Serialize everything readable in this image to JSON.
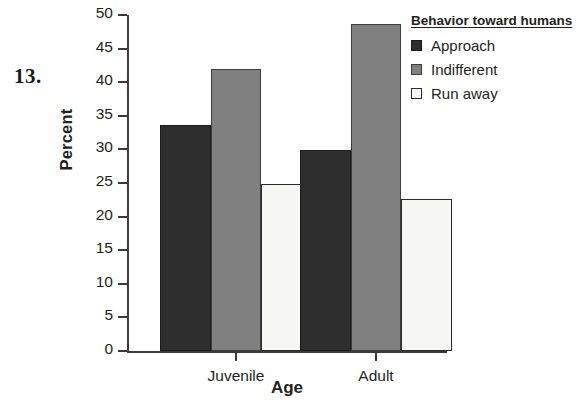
{
  "item_number": "13.",
  "chart_data": {
    "type": "bar",
    "title": "",
    "xlabel": "Age",
    "ylabel": "Percent",
    "categories": [
      "Juvenile",
      "Adult"
    ],
    "series": [
      {
        "name": "Approach",
        "values": [
          33.7,
          29.9
        ],
        "color": "#2e2e2e"
      },
      {
        "name": "Indifferent",
        "values": [
          42.0,
          48.7
        ],
        "color": "#808080"
      },
      {
        "name": "Run away",
        "values": [
          24.8,
          22.6
        ],
        "color": "#f6f6f4"
      }
    ],
    "ylim": [
      0,
      50
    ],
    "yticks": [
      0,
      5,
      10,
      15,
      20,
      25,
      30,
      35,
      40,
      45,
      50
    ],
    "ytick_labels": [
      "0",
      "5",
      "10",
      "15",
      "20",
      "25",
      "30",
      "35",
      "40",
      "45",
      "50"
    ],
    "grid": false,
    "legend_position": "right",
    "legend_title": "Behavior toward humans"
  }
}
